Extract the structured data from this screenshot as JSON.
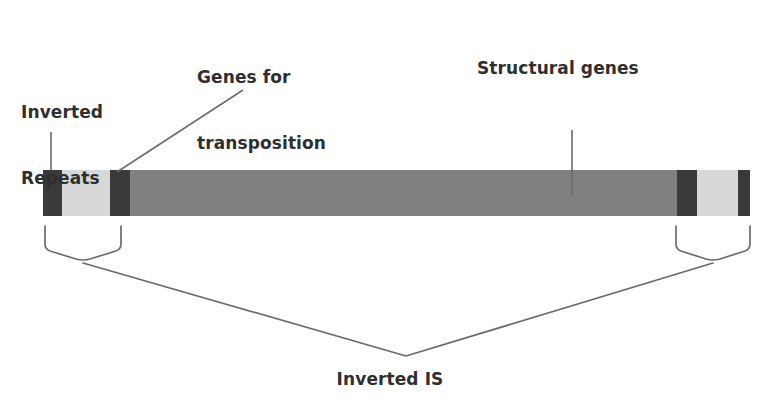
{
  "diagram": {
    "type": "schematic",
    "labels": {
      "inverted_repeats": "Inverted\nRepeats",
      "inverted_repeats_line1": "Inverted",
      "inverted_repeats_line2": "Repeats",
      "genes_for_transposition": "Genes for\ntransposition",
      "genes_for_transposition_line1": "Genes for",
      "genes_for_transposition_line2": "transposition",
      "structural_genes": "Structural genes",
      "inverted_is": "Inverted IS"
    },
    "colors": {
      "background": "#ffffff",
      "text": "#2f2f2f",
      "inverted_repeat_dark": "#3a3a3a",
      "transposition_genes_light": "#d8d8d8",
      "structural_genes_gray": "#808080",
      "leader_line": "#6b6b6b",
      "bracket_line": "#6b6b6b"
    },
    "bar": {
      "x": 43,
      "y": 170,
      "width": 707,
      "height": 46,
      "segments": [
        {
          "name": "left-inverted-repeat-outer",
          "role": "inverted-repeat",
          "x": 43,
          "width": 19,
          "color": "#3a3a3a"
        },
        {
          "name": "left-transposition-genes",
          "role": "genes-for-transposition",
          "x": 62,
          "width": 48,
          "color": "#d8d8d8"
        },
        {
          "name": "left-inverted-repeat-inner",
          "role": "inverted-repeat",
          "x": 110,
          "width": 20,
          "color": "#3a3a3a"
        },
        {
          "name": "structural-genes",
          "role": "structural-genes",
          "x": 130,
          "width": 547,
          "color": "#808080"
        },
        {
          "name": "right-inverted-repeat-inner",
          "role": "inverted-repeat",
          "x": 677,
          "width": 20,
          "color": "#3a3a3a"
        },
        {
          "name": "right-transposition-genes",
          "role": "genes-for-transposition",
          "x": 697,
          "width": 41,
          "color": "#d8d8d8"
        },
        {
          "name": "right-inverted-repeat-outer",
          "role": "inverted-repeat",
          "x": 738,
          "width": 12,
          "color": "#3a3a3a"
        }
      ]
    },
    "leaders": [
      {
        "name": "inverted-repeats-leader",
        "points": "51,132 51,170"
      },
      {
        "name": "genes-for-transposition-leader",
        "points": "243,90 117,172"
      },
      {
        "name": "structural-genes-leader",
        "points": "572,130 572,196"
      }
    ],
    "brackets": [
      {
        "name": "left-is-bracket",
        "tip_left_x": 45,
        "tip_right_x": 121,
        "top_y": 226,
        "shoulder_y": 248,
        "apex_x": 83,
        "apex_y": 263
      },
      {
        "name": "right-is-bracket",
        "tip_left_x": 676,
        "tip_right_x": 750,
        "top_y": 226,
        "shoulder_y": 248,
        "apex_x": 713,
        "apex_y": 263
      }
    ],
    "v_connector": {
      "name": "inverted-is-connector",
      "left_x": 83,
      "left_y": 263,
      "apex_x": 406,
      "apex_y": 356,
      "right_x": 713,
      "right_y": 263
    }
  }
}
